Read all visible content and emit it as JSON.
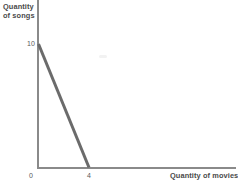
{
  "chart_data": {
    "type": "line",
    "title": "",
    "subtitle": "",
    "xlabel": "Quantity of movies",
    "ylabel": "Quantity of songs",
    "ylabel_lines": "Quantity\nof songs",
    "grid": false,
    "legend": "none",
    "xlim": [
      0,
      13.7
    ],
    "ylim": [
      0,
      13.8
    ],
    "x_ticks": [
      "0",
      "4"
    ],
    "x_tick_values": [
      0,
      4
    ],
    "y_ticks": [
      "10"
    ],
    "y_tick_values": [
      10
    ],
    "origin_label": "0",
    "series": [
      {
        "name": "production possibilities frontier",
        "type": "line",
        "color": "#6b6b6b",
        "width": 3,
        "x": [
          0,
          4
        ],
        "y": [
          10,
          0
        ],
        "points": [
          {
            "x": 0,
            "y": 10,
            "label": "10"
          },
          {
            "x": 4,
            "y": 0,
            "label": "4"
          }
        ]
      }
    ],
    "annotations": []
  },
  "axes": {
    "y_axis_name": "y-axis",
    "x_axis_name": "x-axis",
    "color": "#8a8a8a"
  },
  "colors": {
    "background": "#ffffff",
    "axis": "#8a8a8a",
    "line": "#6b6b6b",
    "label": "#4a4a4a",
    "tick": "#5a5a5a"
  }
}
